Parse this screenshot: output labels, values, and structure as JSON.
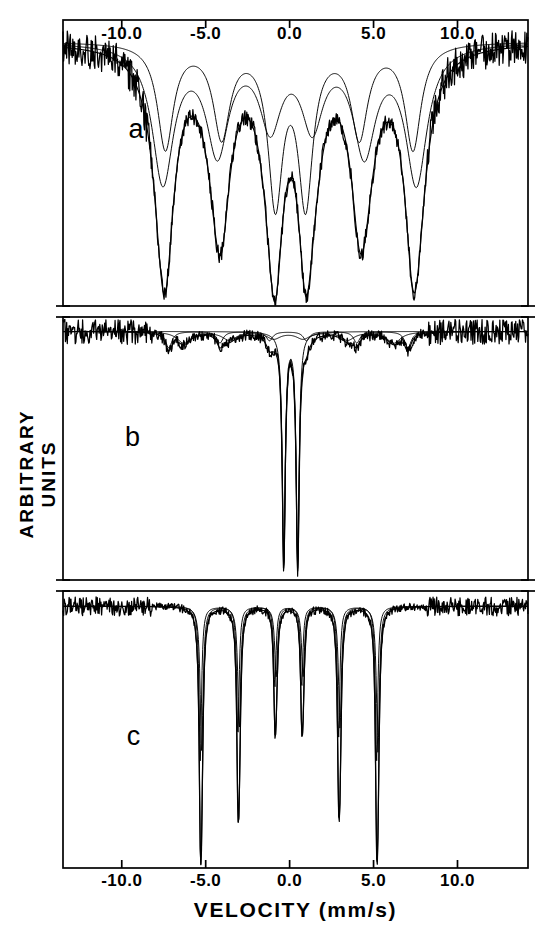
{
  "figure": {
    "axis_x_label": "VELOCITY  (mm/s)",
    "axis_y_label": "ARBITRARY UNITS",
    "x_ticks": [
      -10.0,
      -5.0,
      0.0,
      5.0,
      10.0
    ],
    "x_tick_labels": [
      "-10.0",
      "-5.0",
      "0.0",
      "5.0",
      "10.0"
    ],
    "x_range": [
      -13.5,
      14.2
    ],
    "line_color": "#000000",
    "background_color": "#ffffff",
    "panel_letters": [
      "a",
      "b",
      "c"
    ]
  },
  "chart_data": {
    "type": "line",
    "title": "",
    "xlabel": "VELOCITY  (mm/s)",
    "ylabel": "ARBITRARY UNITS",
    "xlim": [
      -13.5,
      14.2
    ],
    "xticks": [
      -10.0,
      -5.0,
      0.0,
      5.0,
      10.0
    ],
    "xticklabels": [
      "-10.0",
      "-5.0",
      "0.0",
      "5.0",
      "10.0"
    ],
    "grid": false,
    "legend": "none",
    "panels": [
      {
        "label": "a",
        "label_x": -9.6,
        "label_y_frac": 0.33,
        "baseline_frac": 0.075,
        "noise_amplitude": 0.03,
        "subspectra": [
          {
            "name": "sextet-1-broad",
            "centers": [
              -7.55,
              -4.3,
              -1.15,
              1.35,
              4.45,
              7.55
            ],
            "depths": [
              0.6,
              0.46,
              0.34,
              0.34,
              0.46,
              0.6
            ],
            "widths": [
              1.55,
              1.6,
              1.55,
              1.55,
              1.6,
              1.55
            ]
          },
          {
            "name": "sextet-2-broad",
            "centers": [
              -7.4,
              -4.05,
              -0.85,
              0.95,
              4.15,
              7.35
            ],
            "depths": [
              0.46,
              0.4,
              0.68,
              0.68,
              0.4,
              0.46
            ],
            "widths": [
              1.15,
              1.2,
              1.05,
              1.05,
              1.2,
              1.15
            ]
          }
        ]
      },
      {
        "label": "b",
        "label_x": -9.8,
        "label_y_frac": 0.4,
        "baseline_frac": 0.055,
        "noise_amplitude": 0.022,
        "subspectra": [
          {
            "name": "sextet-small",
            "centers": [
              -7.2,
              -4.15,
              -1.2,
              1.0,
              4.0,
              7.05
            ],
            "depths": [
              0.072,
              0.05,
              0.04,
              0.04,
              0.05,
              0.072
            ],
            "widths": [
              0.46,
              0.46,
              0.46,
              0.46,
              0.46,
              0.46
            ]
          },
          {
            "name": "sextet-broad-weak",
            "centers": [
              -6.3,
              -3.6,
              -0.95,
              0.8,
              3.45,
              6.2
            ],
            "depths": [
              0.05,
              0.036,
              0.03,
              0.03,
              0.036,
              0.05
            ],
            "widths": [
              1.0,
              1.0,
              1.0,
              1.0,
              1.0,
              1.0
            ]
          },
          {
            "name": "central-doublet",
            "centers": [
              -0.35,
              0.48
            ],
            "depths": [
              1.02,
              1.02
            ],
            "widths": [
              0.21,
              0.21
            ]
          }
        ]
      },
      {
        "label": "c",
        "label_x": -9.7,
        "label_y_frac": 0.47,
        "baseline_frac": 0.055,
        "noise_amplitude": 0.016,
        "subspectra": [
          {
            "name": "sextet-sharp",
            "centers": [
              -5.32,
              -3.08,
              -0.88,
              0.72,
              2.92,
              5.18
            ],
            "depths": [
              1.02,
              0.86,
              0.53,
              0.53,
              0.86,
              1.02
            ],
            "widths": [
              0.175,
              0.175,
              0.175,
              0.175,
              0.175,
              0.175
            ]
          },
          {
            "name": "sextet-sharp-2",
            "centers": [
              -5.24,
              -3.0,
              -0.8,
              0.8,
              3.0,
              5.26
            ],
            "depths": [
              0.96,
              0.8,
              0.46,
              0.46,
              0.8,
              0.96
            ],
            "widths": [
              0.21,
              0.21,
              0.21,
              0.21,
              0.21,
              0.21
            ]
          }
        ]
      }
    ]
  }
}
